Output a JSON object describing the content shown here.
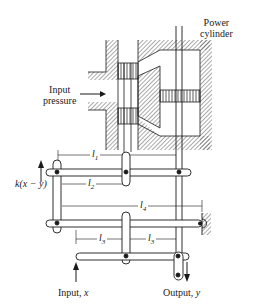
{
  "labels": {
    "power_cylinder_line1": "Power",
    "power_cylinder_line2": "cylinder",
    "input_pressure_line1": "Input",
    "input_pressure_line2": "pressure",
    "feedback": "k(x − y)",
    "l1": "l",
    "l1_sub": "1",
    "l2": "l",
    "l2_sub": "2",
    "l3a": "l",
    "l3a_sub": "3",
    "l3b": "l",
    "l3b_sub": "3",
    "l4": "l",
    "l4_sub": "4",
    "input": "Input, ",
    "input_var": "x",
    "output": "Output, ",
    "output_var": "y"
  },
  "colors": {
    "ink": "#1a1a1a",
    "hatch": "#555555",
    "background": "#ffffff"
  }
}
